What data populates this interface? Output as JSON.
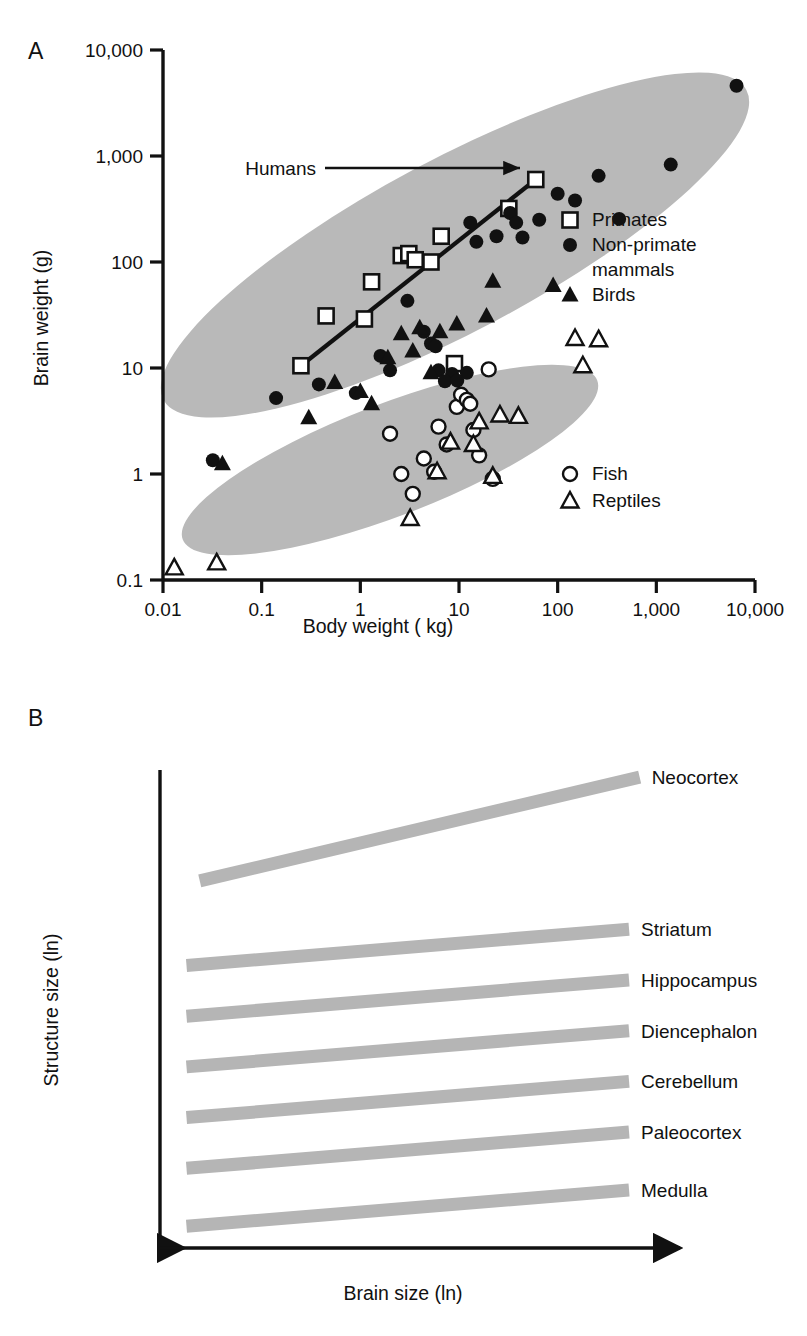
{
  "figure": {
    "background": "#ffffff",
    "ink": "#111111",
    "ellipse_fill": "#b9b9b9",
    "band_fill": "#b5b5b5"
  },
  "panel_a": {
    "letter": "A",
    "chart_data": {
      "type": "scatter",
      "title": "",
      "xlabel": "Body weight ( kg)",
      "ylabel": "Brain weight (g)",
      "xscale": "log",
      "yscale": "log",
      "xlim": [
        0.01,
        10000
      ],
      "ylim": [
        0.1,
        10000
      ],
      "grid": false,
      "xticks": [
        "0.01",
        "0.1",
        "1",
        "10",
        "100",
        "1,000",
        "10,000"
      ],
      "yticks": [
        "0.1",
        "1",
        "10",
        "100",
        "1,000",
        "10,000"
      ],
      "annotations": [
        {
          "text": "Humans",
          "x": 60,
          "y": 600,
          "arrow": true
        }
      ],
      "trendline": {
        "label": "primate regression",
        "x0": 0.25,
        "y0": 10.5,
        "x1": 60,
        "y1": 600
      },
      "legend_position": "right",
      "series": [
        {
          "name": "Primates",
          "marker": "open-square",
          "points": [
            [
              0.25,
              10.5
            ],
            [
              0.45,
              31
            ],
            [
              1.1,
              29
            ],
            [
              1.3,
              65
            ],
            [
              2.6,
              115
            ],
            [
              3.1,
              120
            ],
            [
              3.6,
              105
            ],
            [
              5.2,
              100
            ],
            [
              6.6,
              175
            ],
            [
              9.0,
              11.0
            ],
            [
              32,
              320
            ],
            [
              60,
              600
            ]
          ]
        },
        {
          "name": "Non-primate mammals",
          "marker": "filled-circle",
          "points": [
            [
              0.14,
              5.2
            ],
            [
              0.032,
              1.35
            ],
            [
              0.38,
              7.0
            ],
            [
              0.9,
              5.8
            ],
            [
              2.0,
              9.5
            ],
            [
              3.0,
              43
            ],
            [
              4.4,
              22
            ],
            [
              5.2,
              17
            ],
            [
              5.8,
              16
            ],
            [
              6.2,
              9.5
            ],
            [
              8.5,
              8.8
            ],
            [
              12,
              9.0
            ],
            [
              13,
              235
            ],
            [
              15,
              155
            ],
            [
              24,
              175
            ],
            [
              33,
              290
            ],
            [
              38,
              235
            ],
            [
              44,
              170
            ],
            [
              65,
              250
            ],
            [
              100,
              440
            ],
            [
              150,
              380
            ],
            [
              260,
              650
            ],
            [
              420,
              255
            ],
            [
              1400,
              830
            ],
            [
              6500,
              4600
            ],
            [
              1.6,
              13
            ],
            [
              7.2,
              7.5
            ],
            [
              9.6,
              7.6
            ]
          ]
        },
        {
          "name": "Birds",
          "marker": "filled-triangle",
          "points": [
            [
              0.04,
              1.25
            ],
            [
              0.3,
              3.4
            ],
            [
              0.55,
              7.3
            ],
            [
              1.0,
              6.0
            ],
            [
              1.3,
              4.6
            ],
            [
              1.9,
              12.5
            ],
            [
              2.6,
              21
            ],
            [
              3.4,
              14.5
            ],
            [
              4.0,
              24
            ],
            [
              5.2,
              9.0
            ],
            [
              6.4,
              22
            ],
            [
              9.5,
              26
            ],
            [
              19,
              31
            ],
            [
              22,
              66
            ],
            [
              90,
              60
            ]
          ]
        },
        {
          "name": "Fish",
          "marker": "open-circle",
          "points": [
            [
              2.0,
              2.4
            ],
            [
              2.6,
              1.0
            ],
            [
              3.4,
              0.65
            ],
            [
              4.4,
              1.4
            ],
            [
              5.6,
              1.05
            ],
            [
              7.5,
              1.9
            ],
            [
              9.5,
              4.3
            ],
            [
              10.5,
              5.6
            ],
            [
              12,
              5.0
            ],
            [
              13,
              4.6
            ],
            [
              14,
              2.6
            ],
            [
              16,
              1.5
            ],
            [
              20,
              9.7
            ],
            [
              22,
              0.9
            ],
            [
              6.2,
              2.8
            ]
          ]
        },
        {
          "name": "Reptiles",
          "marker": "open-triangle",
          "points": [
            [
              0.013,
              0.13
            ],
            [
              0.035,
              0.145
            ],
            [
              3.2,
              0.38
            ],
            [
              6.0,
              1.05
            ],
            [
              8.2,
              2.0
            ],
            [
              14,
              1.9
            ],
            [
              16,
              3.1
            ],
            [
              26,
              3.6
            ],
            [
              40,
              3.5
            ],
            [
              150,
              19
            ],
            [
              180,
              10.5
            ],
            [
              260,
              18.5
            ],
            [
              22,
              0.95
            ]
          ]
        }
      ]
    },
    "legend_top": [
      {
        "marker": "open-square",
        "label": "Primates"
      },
      {
        "marker": "filled-circle",
        "label": "Non-primate"
      },
      {
        "marker": "none",
        "label": "mammals"
      },
      {
        "marker": "filled-triangle",
        "label": "Birds"
      }
    ],
    "legend_bottom": [
      {
        "marker": "open-circle",
        "label": "Fish"
      },
      {
        "marker": "open-triangle",
        "label": "Reptiles"
      }
    ]
  },
  "panel_b": {
    "letter": "B",
    "chart_data": {
      "type": "line",
      "title": "",
      "xlabel": "Brain size (ln)",
      "ylabel": "Structure size (ln)",
      "grid": false,
      "axis_ticks": false,
      "note": "Schematic allometric regression bands; relative intercepts and slopes read off the plot.",
      "series": [
        {
          "name": "Neocortex",
          "label": "Neocortex",
          "intercept": 0.76,
          "slope_rise": 0.215,
          "x0": 0.075,
          "x1": 0.905
        },
        {
          "name": "Striatum",
          "label": "Striatum",
          "intercept": 0.585,
          "slope_rise": 0.075,
          "x0": 0.05,
          "x1": 0.885
        },
        {
          "name": "Hippocampus",
          "label": "Hippocampus",
          "intercept": 0.48,
          "slope_rise": 0.075,
          "x0": 0.05,
          "x1": 0.885
        },
        {
          "name": "Diencephalon",
          "label": "Diencephalon",
          "intercept": 0.375,
          "slope_rise": 0.075,
          "x0": 0.05,
          "x1": 0.885
        },
        {
          "name": "Cerebellum",
          "label": "Cerebellum",
          "intercept": 0.27,
          "slope_rise": 0.075,
          "x0": 0.05,
          "x1": 0.885
        },
        {
          "name": "Paleocortex",
          "label": "Paleocortex",
          "intercept": 0.165,
          "slope_rise": 0.075,
          "x0": 0.05,
          "x1": 0.885
        },
        {
          "name": "Medulla",
          "label": "Medulla",
          "intercept": 0.045,
          "slope_rise": 0.075,
          "x0": 0.05,
          "x1": 0.885
        }
      ]
    }
  }
}
